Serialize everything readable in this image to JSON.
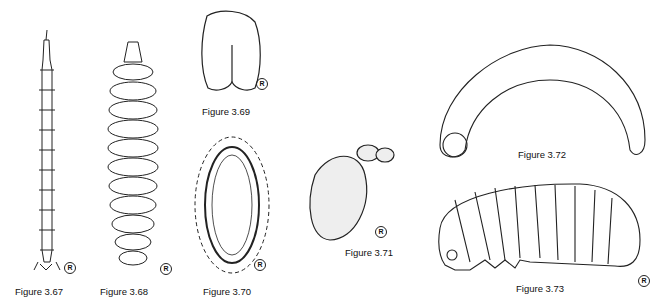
{
  "figures": [
    {
      "id": "3.67",
      "caption": "Figure 3.67",
      "subject": "elongate larva, dorsal view"
    },
    {
      "id": "3.68",
      "caption": "Figure 3.68",
      "subject": "segmented larva, dorsal view"
    },
    {
      "id": "3.69",
      "caption": "Figure 3.69",
      "subject": "pupa"
    },
    {
      "id": "3.70",
      "caption": "Figure 3.70",
      "subject": "puparium / egg case"
    },
    {
      "id": "3.71",
      "caption": "Figure 3.71",
      "subject": "stippled pupa"
    },
    {
      "id": "3.72",
      "caption": "Figure 3.72",
      "subject": "C-shaped grub"
    },
    {
      "id": "3.73",
      "caption": "Figure 3.73",
      "subject": "caterpillar-like larva, lateral view"
    }
  ],
  "mark_symbol": "R",
  "colors": {
    "ink": "#111111",
    "background": "#ffffff"
  }
}
